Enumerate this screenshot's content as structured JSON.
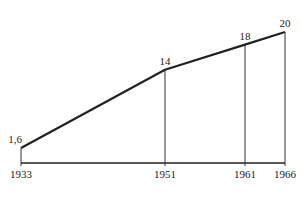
{
  "chart_data": {
    "type": "line",
    "title": "",
    "xlabel": "",
    "ylabel": "",
    "x": [
      1933,
      1951,
      1961,
      1966
    ],
    "x_tick_labels": [
      "1933",
      "1951",
      "1961",
      "1966"
    ],
    "series": [
      {
        "name": "",
        "values": [
          1.6,
          14,
          18,
          20
        ],
        "data_labels": [
          "1,6",
          "14",
          "18",
          "20"
        ]
      }
    ],
    "xlim": [
      1933,
      1966
    ],
    "ylim": [
      0,
      20
    ],
    "grid": false,
    "legend": "none",
    "drop_lines": true
  }
}
